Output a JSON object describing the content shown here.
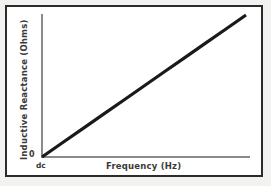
{
  "figure": {
    "background_color": "#ffffff",
    "page_color": "#f2f2f0",
    "border_color": "#2b2b2b",
    "axis_color": "#8a8a8a",
    "data_line_color": "#1a1a1a",
    "text_color": "#3a3a3a"
  },
  "labels": {
    "y_axis_title": "Inductive Reactance (Ohms)",
    "x_axis_title": "Frequency (Hz)",
    "y_origin": "0",
    "x_origin": "dc"
  },
  "chart_data": {
    "type": "line",
    "title": "",
    "subtitle": "",
    "xlabel": "Frequency (Hz)",
    "ylabel": "Inductive Reactance (Ohms)",
    "xlim": [
      0,
      100
    ],
    "ylim": [
      0,
      100
    ],
    "grid": false,
    "legend": null,
    "x_tick_labels": [
      "dc"
    ],
    "y_tick_labels": [
      "0"
    ],
    "annotations": [
      "Inductive reactance rises linearly with frequency",
      "At dc (0 Hz) the inductive reactance is 0 ohms"
    ],
    "series": [
      {
        "name": "Inductive Reactance XL",
        "x": [
          0,
          10,
          20,
          30,
          40,
          50,
          60,
          70,
          80,
          90,
          100
        ],
        "values": [
          0,
          10,
          20,
          30,
          40,
          50,
          60,
          70,
          80,
          90,
          100
        ],
        "line_width_px": 3,
        "color": "#1a1a1a",
        "style": "solid"
      }
    ]
  }
}
